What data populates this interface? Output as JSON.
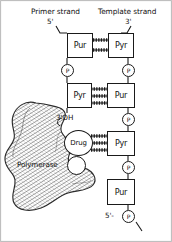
{
  "figure": {
    "title_left": "Primer strand",
    "title_right": "Template strand",
    "ends": {
      "primer_5prime": "5'",
      "template_3prime": "3'",
      "primer_3prime_oh": "3'OH",
      "template_5prime_p": "5'-",
      "phosphate_letter": "P"
    },
    "labels": {
      "drug": "Drug",
      "polymerase": "Polymerase"
    },
    "colors": {
      "ink": "#1a1a1a",
      "paper": "#ffffff",
      "hatch": "#3a3a3a"
    },
    "base_pairs": [
      {
        "left": "Pur",
        "right": "Pyr",
        "hbonds": 2
      },
      {
        "left": "Pyr",
        "right": "Pur",
        "hbonds": 3
      },
      {
        "left": "Drug",
        "right": "Pyr",
        "hbonds": 3
      },
      {
        "left": "",
        "right": "Pur",
        "hbonds": 0
      }
    ],
    "left_strand_bases": [
      "Pur",
      "Pyr"
    ],
    "right_strand_bases": [
      "Pyr",
      "Pur",
      "Pyr",
      "Pur"
    ],
    "phosphates": [
      {
        "strand": "primer",
        "letter": "P"
      },
      {
        "strand": "template",
        "letter": "P"
      },
      {
        "strand": "template",
        "letter": "P"
      },
      {
        "strand": "template",
        "letter": "P"
      },
      {
        "strand": "template",
        "letter": "P"
      }
    ]
  }
}
